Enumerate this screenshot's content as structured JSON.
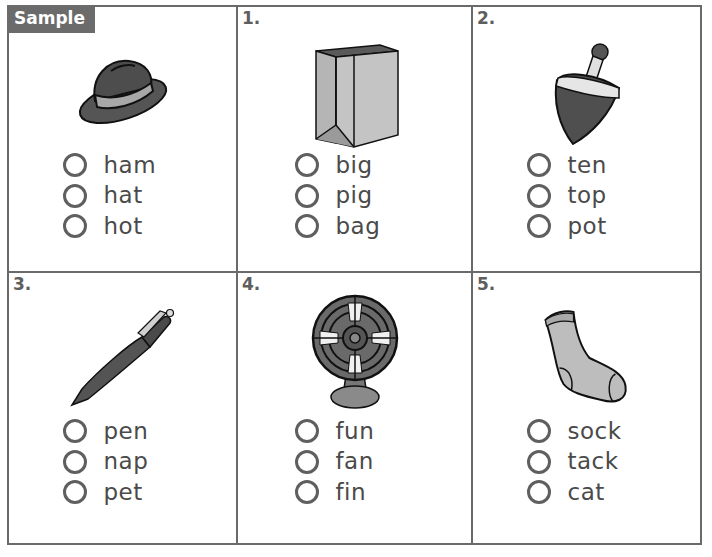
{
  "worksheet": {
    "items": [
      {
        "label": "Sample",
        "picture": "hat",
        "options": [
          "ham",
          "hat",
          "hot"
        ]
      },
      {
        "label": "1.",
        "picture": "paper-bag",
        "options": [
          "big",
          "pig",
          "bag"
        ]
      },
      {
        "label": "2.",
        "picture": "spinning-top",
        "options": [
          "ten",
          "top",
          "pot"
        ]
      },
      {
        "label": "3.",
        "picture": "pen",
        "options": [
          "pen",
          "nap",
          "pet"
        ]
      },
      {
        "label": "4.",
        "picture": "fan",
        "options": [
          "fun",
          "fan",
          "fin"
        ]
      },
      {
        "label": "5.",
        "picture": "sock",
        "options": [
          "sock",
          "tack",
          "cat"
        ]
      }
    ]
  },
  "colors": {
    "border": "#6a6a6a",
    "sample_tag_bg": "#6b6b6b",
    "text": "#4a4a4a",
    "bubble": "#5f5f5f"
  }
}
